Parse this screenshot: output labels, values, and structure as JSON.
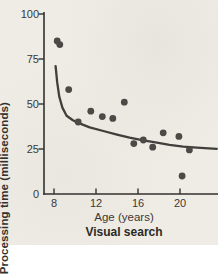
{
  "figure": {
    "background_color": "#efece6",
    "axis_color": "#33312e",
    "point_color": "#4c4a47",
    "curve_color": "#413f3c",
    "text_color": "#3b3834"
  },
  "chart_data": {
    "type": "scatter",
    "title": "Visual search",
    "xlabel": "Age (years)",
    "ylabel": "Processing time (milliseconds)",
    "xlim": [
      7,
      23.6
    ],
    "ylim": [
      0,
      100
    ],
    "x_ticks": [
      8,
      12,
      16,
      20
    ],
    "y_ticks": [
      0,
      25,
      50,
      75,
      100
    ],
    "grid": false,
    "legend": "none",
    "points": [
      [
        8.3,
        85
      ],
      [
        8.55,
        83
      ],
      [
        9.4,
        58
      ],
      [
        10.3,
        40
      ],
      [
        11.5,
        46
      ],
      [
        12.6,
        43
      ],
      [
        13.6,
        42
      ],
      [
        14.7,
        51
      ],
      [
        15.6,
        28
      ],
      [
        16.5,
        30
      ],
      [
        17.4,
        26
      ],
      [
        18.4,
        34
      ],
      [
        19.9,
        32
      ],
      [
        20.2,
        10
      ],
      [
        20.9,
        24.5
      ]
    ],
    "fit_curve": {
      "description": "decreasing fit approaching asymptote near 25 ms",
      "points": [
        [
          8.15,
          71
        ],
        [
          8.3,
          62
        ],
        [
          8.5,
          54
        ],
        [
          8.8,
          48
        ],
        [
          9.2,
          43.5
        ],
        [
          9.8,
          41
        ],
        [
          10.3,
          39.5
        ],
        [
          11.4,
          37
        ],
        [
          12.7,
          35
        ],
        [
          14.0,
          33
        ],
        [
          15.2,
          31.3
        ],
        [
          16.5,
          29.8
        ],
        [
          17.8,
          28.5
        ],
        [
          19.0,
          27.3
        ],
        [
          20.3,
          26.3
        ],
        [
          21.6,
          25.7
        ],
        [
          23.5,
          25.1
        ]
      ]
    }
  }
}
